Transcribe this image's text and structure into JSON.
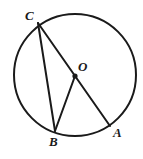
{
  "figure": {
    "type": "circle-geometry-diagram",
    "canvas": {
      "width": 143,
      "height": 159,
      "background": "#ffffff"
    },
    "stroke_color": "#1a1a1a",
    "label_color": "#1a1a1a",
    "circle": {
      "name": "circle-outline",
      "center_x": 75,
      "center_y": 75,
      "radius": 61,
      "stroke_width": 2,
      "fill": "none"
    },
    "points": [
      {
        "id": "C",
        "label": "C",
        "x": 38,
        "y": 23,
        "on_circle": true,
        "dot": false
      },
      {
        "id": "O",
        "label": "O",
        "x": 75,
        "y": 76,
        "on_circle": false,
        "dot": true
      },
      {
        "id": "B",
        "label": "B",
        "x": 55,
        "y": 131,
        "on_circle": true,
        "dot": false
      },
      {
        "id": "A",
        "label": "A",
        "x": 110,
        "y": 126,
        "on_circle": true,
        "dot": false
      }
    ],
    "segments": [
      {
        "id": "CB",
        "from": "C",
        "to": "B",
        "x1": 38,
        "y1": 23,
        "x2": 55,
        "y2": 131,
        "stroke_width": 2
      },
      {
        "id": "CA",
        "from": "C",
        "to": "A",
        "x1": 38,
        "y1": 23,
        "x2": 110,
        "y2": 126,
        "stroke_width": 2,
        "note": "diameter through O"
      },
      {
        "id": "OB",
        "from": "O",
        "to": "B",
        "x1": 75,
        "y1": 76,
        "x2": 55,
        "y2": 131,
        "stroke_width": 2
      }
    ],
    "center_dot": {
      "x": 75,
      "y": 76,
      "radius": 2.6
    }
  },
  "labels": {
    "c": "C",
    "o": "O",
    "b": "B",
    "a": "A"
  }
}
